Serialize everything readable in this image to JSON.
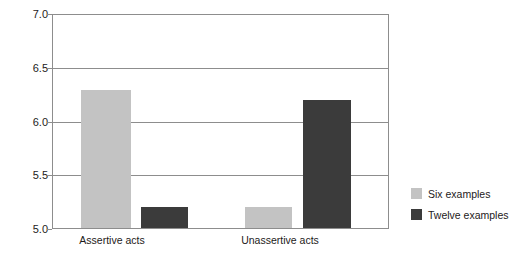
{
  "chart_data": {
    "type": "bar",
    "title": "",
    "subtitle": "",
    "xlabel": "",
    "ylabel": "Self-rated assertiveness",
    "categories": [
      "Assertive acts",
      "Unassertive acts"
    ],
    "series": [
      {
        "name": "Six examples",
        "color": "#c3c3c3",
        "values": [
          6.3,
          5.2
        ]
      },
      {
        "name": "Twelve examples",
        "color": "#3b3b3b",
        "values": [
          5.2,
          6.2
        ]
      }
    ],
    "ylim": [
      5.0,
      7.0
    ],
    "yticks": [
      7.0,
      6.5,
      6.0,
      5.5,
      5.0
    ],
    "ytick_labels": [
      "7.0",
      "6.5",
      "6.0",
      "5.5",
      "5.0"
    ],
    "grid": true,
    "grid_axis": "y",
    "legend_position": "right",
    "legend_entries": [
      "Six examples",
      "Twelve examples"
    ],
    "annotations": [],
    "axis_color": "#8d8d8d",
    "background": "#ffffff"
  },
  "axis": {
    "y_title": "Self-rated assertiveness",
    "y_ticks": [
      {
        "label": "7.0",
        "value": 7.0
      },
      {
        "label": "6.5",
        "value": 6.5
      },
      {
        "label": "6.0",
        "value": 6.0
      },
      {
        "label": "5.5",
        "value": 5.5
      },
      {
        "label": "5.0",
        "value": 5.0
      }
    ],
    "x_ticks": [
      {
        "label": "Assertive acts"
      },
      {
        "label": "Unassertive acts"
      }
    ]
  },
  "legend": {
    "items": [
      {
        "label": "Six examples",
        "color": "#c3c3c3"
      },
      {
        "label": "Twelve examples",
        "color": "#3b3b3b"
      }
    ]
  },
  "bars": [
    {
      "name": "assertive-six",
      "group": "Assertive acts",
      "series": "Six examples",
      "value": 6.3,
      "color": "#c3c3c3"
    },
    {
      "name": "assertive-twelve",
      "group": "Assertive acts",
      "series": "Twelve examples",
      "value": 5.2,
      "color": "#3b3b3b"
    },
    {
      "name": "unassertive-six",
      "group": "Unassertive acts",
      "series": "Six examples",
      "value": 5.2,
      "color": "#c3c3c3"
    },
    {
      "name": "unassertive-twelve",
      "group": "Unassertive acts",
      "series": "Twelve examples",
      "value": 6.2,
      "color": "#3b3b3b"
    }
  ]
}
